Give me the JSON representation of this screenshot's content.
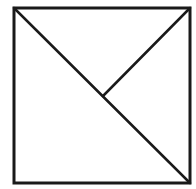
{
  "diagram": {
    "type": "geometric-figure",
    "background": "#ffffff",
    "stroke_color": "#1a1a1a",
    "square": {
      "x1": 14,
      "y1": 8,
      "x2": 190,
      "y2": 183,
      "stroke_width": 3
    },
    "segments": [
      {
        "name": "main-diagonal",
        "from": [
          14,
          8
        ],
        "to": [
          190,
          183
        ]
      },
      {
        "name": "partial-diagonal",
        "from": [
          190,
          8
        ],
        "to": [
          103,
          96
        ]
      }
    ],
    "labels": []
  }
}
